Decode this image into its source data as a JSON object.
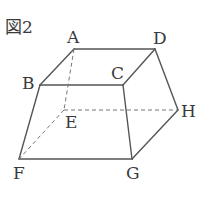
{
  "figure": {
    "title": "図2",
    "shape": "frustum (truncated pyramid) ABCD-EFGH",
    "colors": {
      "line": "#555555",
      "text": "#3a3a3a"
    }
  },
  "vertices": {
    "A": {
      "label": "A",
      "x": 74,
      "y": 49
    },
    "B": {
      "label": "B",
      "x": 40,
      "y": 85
    },
    "C": {
      "label": "C",
      "x": 123,
      "y": 85
    },
    "D": {
      "label": "D",
      "x": 155,
      "y": 49
    },
    "E": {
      "label": "E",
      "x": 64,
      "y": 110
    },
    "F": {
      "label": "F",
      "x": 19,
      "y": 159
    },
    "G": {
      "label": "G",
      "x": 132,
      "y": 159
    },
    "H": {
      "label": "H",
      "x": 178,
      "y": 110
    }
  },
  "edges": {
    "solid": [
      "AB",
      "AD",
      "BC",
      "CD",
      "BF",
      "CG",
      "DH",
      "FG",
      "GH"
    ],
    "dashed": [
      "AE",
      "EF",
      "EH"
    ]
  }
}
